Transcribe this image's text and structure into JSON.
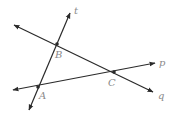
{
  "diagram": {
    "lines": [
      {
        "id": "t",
        "label": "t"
      },
      {
        "id": "p",
        "label": "p"
      },
      {
        "id": "q",
        "label": "q"
      }
    ],
    "points": [
      {
        "id": "A",
        "label": "A",
        "on_lines": [
          "t",
          "p"
        ]
      },
      {
        "id": "B",
        "label": "B",
        "on_lines": [
          "t",
          "q"
        ]
      },
      {
        "id": "C",
        "label": "C",
        "on_lines": [
          "p",
          "q"
        ]
      }
    ]
  }
}
